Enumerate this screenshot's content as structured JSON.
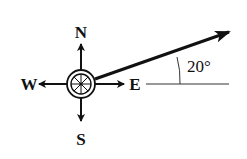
{
  "diagram": {
    "type": "compass-vector",
    "compass": {
      "labels": {
        "north": "N",
        "south": "S",
        "east": "E",
        "west": "W"
      }
    },
    "vector": {
      "direction": "east of north, above east axis",
      "angle_label": "20°",
      "angle_degrees": 20,
      "reference": "E axis (horizontal)"
    },
    "colors": {
      "ink": "#111111",
      "background": "#ffffff"
    }
  }
}
